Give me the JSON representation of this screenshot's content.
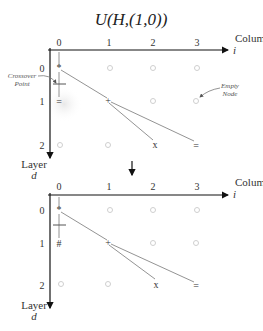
{
  "title": "U(H,(1,0))",
  "axes": {
    "column_label": "Column",
    "column_var": "i",
    "layer_label": "Layer",
    "layer_var": "d",
    "column_ticks": [
      "0",
      "1",
      "2",
      "3"
    ],
    "layer_ticks": [
      "0",
      "1",
      "2"
    ]
  },
  "annotations": {
    "crossover_line1": "Crossover",
    "crossover_line2": "Point",
    "empty_line1": "Empty",
    "empty_line2": "Node"
  },
  "top_diagram": {
    "nodes": {
      "n00": "*",
      "n11": "+",
      "n10": "=",
      "n22": "x",
      "n23": "="
    }
  },
  "bottom_diagram": {
    "nodes": {
      "n00": "*",
      "n11": "+",
      "n10": "#",
      "n22": "x",
      "n23": "="
    }
  },
  "colors": {
    "axis": "#111111",
    "edge": "#777777",
    "empty_node": "#cfcfcf",
    "highlight": "#eeeeee"
  }
}
